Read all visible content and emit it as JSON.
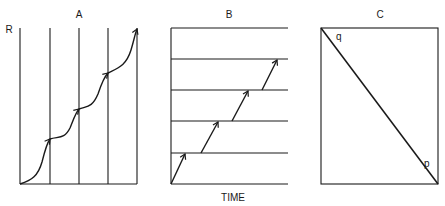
{
  "panels": {
    "a": {
      "title": "A",
      "y_label": "R"
    },
    "b": {
      "title": "B",
      "x_label": "TIME"
    },
    "c": {
      "title": "C",
      "corner_top_label": "q",
      "corner_bottom_label": "p"
    }
  },
  "colors": {
    "line": "#1a1a1a",
    "background": "#ffffff"
  }
}
